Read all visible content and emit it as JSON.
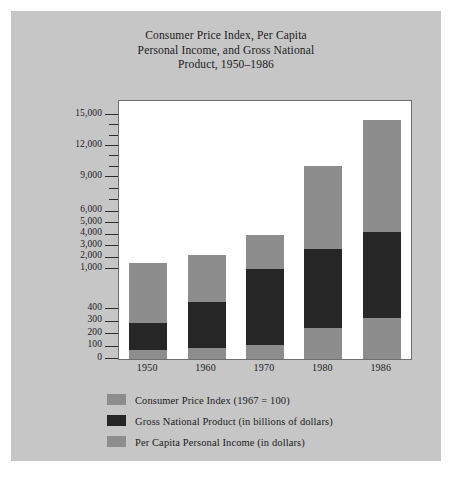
{
  "title": {
    "line1": "Consumer Price Index, Per Capita",
    "line2": "Personal Income, and Gross National",
    "line3": "Product, 1950–1986"
  },
  "colors": {
    "page_background": "#c6c6c6",
    "plot_background": "#ffffff",
    "cpi": "#8d8d8d",
    "gnp": "#262626",
    "pcpi": "#8d8d8d",
    "axis": "#2b2b2b",
    "text": "#1b1b1b"
  },
  "legend": {
    "position": "below-plot",
    "items": [
      {
        "label": "Consumer Price Index (1967 = 100)",
        "color": "#8d8d8d",
        "key": "cpi"
      },
      {
        "label": "Gross National Product (in billions of dollars)",
        "color": "#262626",
        "key": "gnp"
      },
      {
        "label": "Per Capita Personal Income (in dollars)",
        "color": "#8d8d8d",
        "key": "pcpi"
      }
    ]
  },
  "chart_data": {
    "type": "bar",
    "stacked": true,
    "xlabel": "",
    "ylabel": "",
    "grid": false,
    "broken_axis": true,
    "axis_note": "Lower scale 0-400 expanded; upper scale 1,000-15,000 compressed",
    "categories": [
      "1950",
      "1960",
      "1970",
      "1980",
      "1986"
    ],
    "ytick_labels": [
      "0",
      "100",
      "200",
      "300",
      "400",
      "1,000",
      "2,000",
      "3,000",
      "4,000",
      "5,000",
      "6,000",
      "9,000",
      "12,000",
      "15,000"
    ],
    "ylim": [
      0,
      15000
    ],
    "series": [
      {
        "name": "Per Capita Personal Income (in dollars)",
        "key": "pcpi",
        "color": "#8d8d8d",
        "values": [
          1500,
          2200,
          4000,
          10100,
          14500
        ]
      },
      {
        "name": "Gross National Product (in billions of dollars)",
        "key": "gnp",
        "color": "#262626",
        "values": [
          286,
          506,
          1015,
          2732,
          4235
        ]
      },
      {
        "name": "Consumer Price Index (1967 = 100)",
        "key": "cpi",
        "color": "#8d8d8d",
        "values": [
          72,
          89,
          116,
          247,
          328
        ]
      }
    ]
  }
}
